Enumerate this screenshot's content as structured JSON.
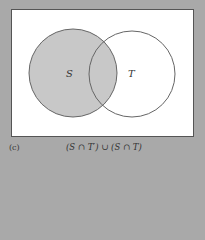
{
  "diagram": {
    "type": "venn",
    "sets": [
      {
        "name": "S",
        "shaded": true
      },
      {
        "name": "T",
        "shaded": false
      }
    ],
    "shaded_region": "S (both S∩T' and S∩T)",
    "colors": {
      "background": "#a9a9a9",
      "universe_fill": "#ffffff",
      "shade": "#c8c8c8",
      "outline": "#666666"
    }
  },
  "labels": {
    "set_s": "S",
    "set_t": "T"
  },
  "caption": {
    "part": "(c)",
    "expression": "(S ∩ T′) ∪ (S ∩ T)"
  }
}
